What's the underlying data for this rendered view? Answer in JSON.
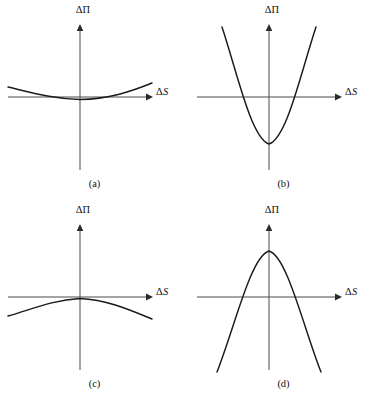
{
  "figure": {
    "title": "",
    "background_color": "#ffffff",
    "curve_color": "#1a1a1a",
    "axis_color": "#4a4a4a",
    "text_color": "#111111",
    "axis_labels": {
      "y": "ΔΠ",
      "x_delta": "Δ",
      "x_var": "S"
    }
  },
  "chart_data": {
    "type": "line",
    "title": "",
    "xlabel": "ΔS",
    "ylabel": "ΔΠ",
    "grid": false,
    "legend": null,
    "panels": [
      {
        "id": "a",
        "caption": "(a)",
        "description": "shallow upward-opening parabola, vertex slightly below the ΔS axis",
        "curvature_sign": "positive",
        "curvature_magnitude": "shallow",
        "vertex": {
          "x": 0,
          "y": -0.12
        },
        "opens": "up",
        "x_range": [
          -1.0,
          1.0
        ],
        "y_range": [
          -1.0,
          1.0
        ],
        "roots": "none visible within plotted range",
        "path": "M 8,87 C 30,92 52,99 80,99.5 C 108,99 130,92 152,83"
      },
      {
        "id": "b",
        "caption": "(b)",
        "description": "steep upward-opening parabola, vertex well below the ΔS axis, crosses axis at two points",
        "curvature_sign": "positive",
        "curvature_magnitude": "steep",
        "vertex": {
          "x": 0,
          "y": -0.62
        },
        "opens": "up",
        "x_range": [
          -1.0,
          1.0
        ],
        "y_range": [
          -1.0,
          1.0
        ],
        "roots": [
          -0.42,
          0.42
        ],
        "path": "M 33,27 C 48,72 62,138 80,144 C 98,138 112,72 127,27"
      },
      {
        "id": "c",
        "caption": "(c)",
        "description": "shallow downward-opening parabola, vertex slightly above the ΔS axis",
        "curvature_sign": "negative",
        "curvature_magnitude": "shallow",
        "vertex": {
          "x": 0,
          "y": 0.12
        },
        "opens": "down",
        "x_range": [
          -1.0,
          1.0
        ],
        "y_range": [
          -1.0,
          1.0
        ],
        "roots": [
          -0.55,
          0.55
        ],
        "path": "M 8,116 C 30,110 52,100 80,98.5 C 108,100 130,110 152,119"
      },
      {
        "id": "d",
        "caption": "(d)",
        "description": "steep downward-opening parabola, vertex well above the ΔS axis, crosses axis at two points",
        "curvature_sign": "negative",
        "curvature_magnitude": "steep",
        "vertex": {
          "x": 0,
          "y": 0.58
        },
        "opens": "down",
        "x_range": [
          -1.0,
          1.0
        ],
        "y_range": [
          -1.0,
          1.0
        ],
        "roots": [
          -0.4,
          0.4
        ],
        "path": "M 28,172 C 46,126 62,56 80,51 C 98,56 114,126 132,172"
      }
    ],
    "axes_geometry": {
      "origin_x": 80,
      "axis_y": 97,
      "x_axis_start": 8,
      "x_axis_end": 150,
      "y_axis_top": 25,
      "y_axis_bottom": 170
    }
  },
  "panels": {
    "a": {
      "caption": "(a)"
    },
    "b": {
      "caption": "(b)"
    },
    "c": {
      "caption": "(c)"
    },
    "d": {
      "caption": "(d)"
    }
  }
}
